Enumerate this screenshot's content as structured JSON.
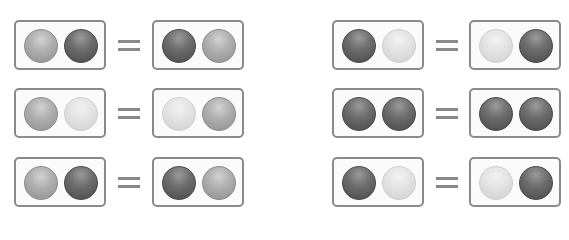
{
  "equations": [
    {
      "row": 0,
      "col": 0,
      "left": [
        "medium",
        "dark"
      ],
      "right": [
        "dark",
        "medium"
      ],
      "operator": "="
    },
    {
      "row": 0,
      "col": 1,
      "left": [
        "dark",
        "light"
      ],
      "right": [
        "light",
        "dark"
      ],
      "operator": "="
    },
    {
      "row": 1,
      "col": 0,
      "left": [
        "medium",
        "light"
      ],
      "right": [
        "light",
        "medium"
      ],
      "operator": "="
    },
    {
      "row": 1,
      "col": 1,
      "left": [
        "dark",
        "dark"
      ],
      "right": [
        "dark",
        "dark"
      ],
      "operator": "="
    },
    {
      "row": 2,
      "col": 0,
      "left": [
        "medium",
        "dark"
      ],
      "right": [
        "dark",
        "medium"
      ],
      "operator": "="
    },
    {
      "row": 2,
      "col": 1,
      "left": [
        "dark",
        "light"
      ],
      "right": [
        "light",
        "dark"
      ],
      "operator": "="
    }
  ],
  "colors": {
    "light": "#e0e0e0",
    "medium": "#aaaaaa",
    "dark": "#666666",
    "border": "#8a8a8a"
  }
}
